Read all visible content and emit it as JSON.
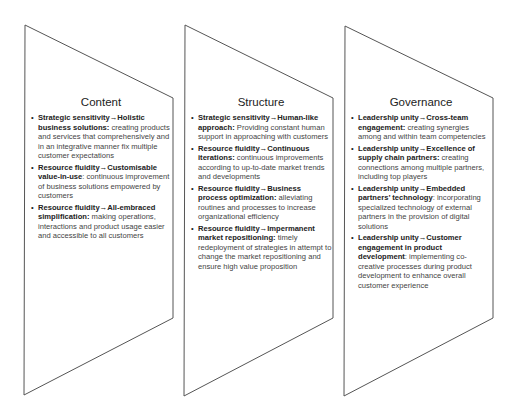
{
  "panels": [
    {
      "title": "Content",
      "items": [
        {
          "lead": "Strategic sensitivity→Holistic business solutions:",
          "text": " creating products and services that comprehensively and in an integrative manner fix multiple customer expectations"
        },
        {
          "lead": "Resource fluidity→Customisable value-in-use",
          "text": ": continuous improvement of business solutions empowered by customers"
        },
        {
          "lead": "Resource fluidity→All-embraced simplification:",
          "text": " making operations, interactions and product usage easier and accessible to all customers"
        }
      ]
    },
    {
      "title": "Structure",
      "items": [
        {
          "lead": "Strategic sensitivity→Human-like approach:",
          "text": " Providing constant human support in approaching with customers"
        },
        {
          "lead": "Resource fluidity→Continuous iterations:",
          "text": " continuous improvements according to up-to-date market trends and developments"
        },
        {
          "lead": "Resource fluidity→Business process optimization:",
          "text": " alleviating routines and processes to increase organizational efficiency"
        },
        {
          "lead": "Resource fluidity→Impermanent market repositioning:",
          "text": " timely redeployment of strategies in attempt to change the market repositioning and ensure high value proposition"
        }
      ]
    },
    {
      "title": "Governance",
      "items": [
        {
          "lead": "Leadership unity→Cross-team engagement:",
          "text": " creating synergies among and within team competencies"
        },
        {
          "lead": "Leadership unity→Excellence of supply chain partners:",
          "text": " creating connections among multiple partners, including top players"
        },
        {
          "lead": "Leadership unity→Embedded partners’ technology",
          "text": ": incorporating specialized technology of external partners in the provision of digital solutions"
        },
        {
          "lead": "Leadership unity→Customer engagement in product development",
          "text": ": implementing co-creative processes during product development to enhance overall customer experience"
        }
      ]
    }
  ],
  "colors": {
    "outline": "#555555",
    "text": "#444444",
    "heading": "#222222"
  }
}
